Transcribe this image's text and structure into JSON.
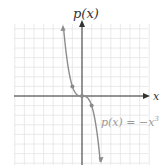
{
  "chart_data": {
    "type": "line",
    "title": "",
    "xlabel": "x",
    "ylabel": "p(x)",
    "function_label": "p(x) = −x³",
    "xlim": [
      -7,
      7
    ],
    "ylim": [
      -7,
      7
    ],
    "grid": true,
    "grid_step": 1,
    "series": [
      {
        "name": "p(x) = −x³",
        "x": [
          -1.9,
          -1.5,
          -1,
          -0.5,
          0,
          0.5,
          1,
          1.5,
          1.9
        ],
        "y": [
          6.86,
          3.375,
          1,
          0.125,
          0,
          -0.125,
          -1,
          -3.375,
          -6.86
        ],
        "marked_points": [
          [
            -1,
            1
          ],
          [
            0,
            0
          ],
          [
            1,
            -1
          ]
        ],
        "color": "#8a8a8a"
      }
    ]
  },
  "labels": {
    "y_axis": "p(x)",
    "x_axis": "x",
    "curve": "p(x) = −x"
  },
  "colors": {
    "grid": "#e4e4e4",
    "axis": "#333333",
    "curve": "#8c8c8c",
    "label": "#9a9a9a"
  }
}
